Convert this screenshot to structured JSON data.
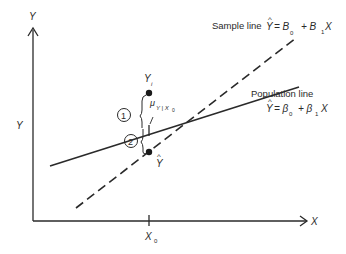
{
  "diagram": {
    "y_axis_label_top": "Y",
    "y_axis_label_side": "Y",
    "x_axis_label": "X",
    "x_tick_label": "X",
    "x_tick_sub": "0",
    "sample_line": {
      "label": "Sample line",
      "eq_lhs": "Y",
      "eq_hat": "^",
      "eq_mid": "= B",
      "sub0": "0",
      "plus": "+ B",
      "sub1": "1",
      "tail": "X",
      "style": "dashed"
    },
    "population_line": {
      "label": "Population line",
      "eq_lhs": "Y",
      "eq_hat": "^",
      "eq_mid": "= β",
      "sub0": "0",
      "plus": "+ β",
      "sub1": "1",
      "tail": "X",
      "style": "solid"
    },
    "points": {
      "yi_label": "Y",
      "yi_sub": "i",
      "yhat_label": "Y",
      "yhat_hat": "^",
      "mu_label": "μ",
      "mu_sub": "Y | X",
      "mu_sub0": "0"
    },
    "markers": {
      "circle1": "1",
      "circle2": "2"
    },
    "colors": {
      "ink": "#2a2a2a",
      "background": "#ffffff"
    }
  }
}
